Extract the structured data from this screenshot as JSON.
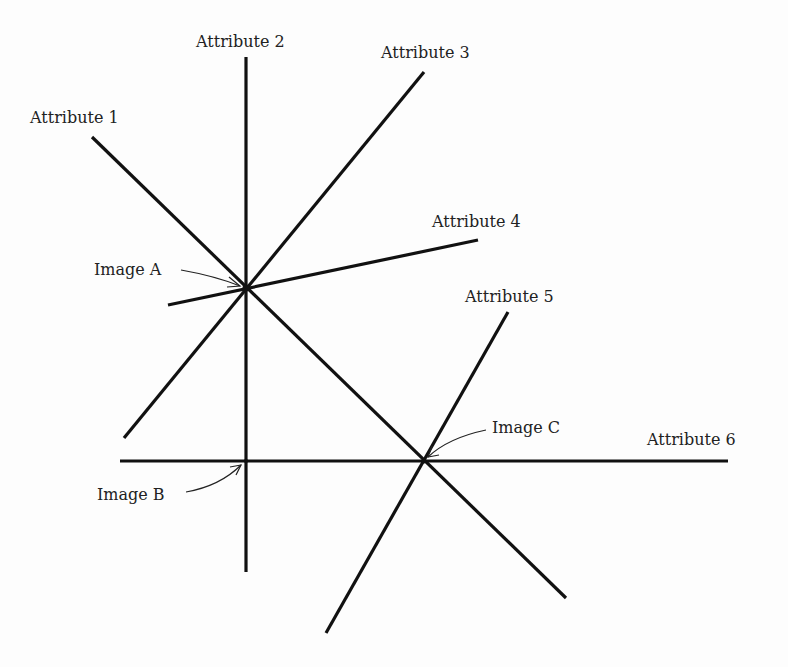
{
  "diagram": {
    "type": "attribute-space-lines",
    "attributes": [
      {
        "label": "Attribute 1",
        "x1": 92,
        "y1": 137,
        "x2": 566,
        "y2": 598,
        "lx": 30,
        "ly": 123
      },
      {
        "label": "Attribute 2",
        "x1": 246,
        "y1": 57,
        "x2": 246,
        "y2": 572,
        "lx": 196,
        "ly": 47
      },
      {
        "label": "Attribute 3",
        "x1": 424,
        "y1": 72,
        "x2": 124,
        "y2": 438,
        "lx": 381,
        "ly": 58
      },
      {
        "label": "Attribute 4",
        "x1": 168,
        "y1": 305,
        "x2": 478,
        "y2": 240,
        "lx": 432,
        "ly": 227
      },
      {
        "label": "Attribute 5",
        "x1": 508,
        "y1": 312,
        "x2": 326,
        "y2": 633,
        "lx": 465,
        "ly": 302
      },
      {
        "label": "Attribute 6",
        "x1": 120,
        "y1": 461,
        "x2": 728,
        "y2": 461,
        "lx": 647,
        "ly": 445
      }
    ],
    "images": [
      {
        "label": "Image A",
        "x": 246,
        "y": 288,
        "lx": 94,
        "ly": 275
      },
      {
        "label": "Image B",
        "x": 246,
        "y": 461,
        "lx": 97,
        "ly": 500
      },
      {
        "label": "Image C",
        "x": 424,
        "y": 461,
        "lx": 492,
        "ly": 433
      }
    ]
  }
}
